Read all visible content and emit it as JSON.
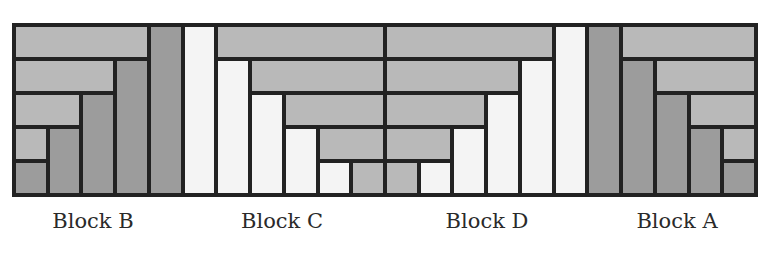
{
  "diagram": {
    "type": "log-cabin quilt blocks",
    "grid": {
      "columns": 22,
      "rows": 5,
      "border_px": 4
    },
    "colors": {
      "light": "#b9b9b9",
      "dark": "#9c9c9c",
      "white": "#f4f4f4",
      "line": "#222222"
    },
    "blocks": [
      {
        "label": "Block B",
        "col_start": 0,
        "col_end": 5,
        "label_x": 93
      },
      {
        "label": "Block C",
        "col_start": 5,
        "col_end": 11,
        "label_x": 282
      },
      {
        "label": "Block D",
        "col_start": 11,
        "col_end": 17,
        "label_x": 487
      },
      {
        "label": "Block A",
        "col_start": 17,
        "col_end": 22,
        "label_x": 677
      }
    ],
    "pieces": [
      {
        "block": "B",
        "c": 0,
        "r": 0,
        "w": 4,
        "h": 1,
        "color": "light"
      },
      {
        "block": "B",
        "c": 4,
        "r": 0,
        "w": 1,
        "h": 5,
        "color": "dark"
      },
      {
        "block": "B",
        "c": 0,
        "r": 1,
        "w": 3,
        "h": 1,
        "color": "light"
      },
      {
        "block": "B",
        "c": 3,
        "r": 1,
        "w": 1,
        "h": 4,
        "color": "dark"
      },
      {
        "block": "B",
        "c": 0,
        "r": 2,
        "w": 2,
        "h": 1,
        "color": "light"
      },
      {
        "block": "B",
        "c": 2,
        "r": 2,
        "w": 1,
        "h": 3,
        "color": "dark"
      },
      {
        "block": "B",
        "c": 0,
        "r": 3,
        "w": 1,
        "h": 1,
        "color": "light"
      },
      {
        "block": "B",
        "c": 1,
        "r": 3,
        "w": 1,
        "h": 2,
        "color": "dark"
      },
      {
        "block": "B",
        "c": 0,
        "r": 4,
        "w": 1,
        "h": 1,
        "color": "dark"
      },
      {
        "block": "C",
        "c": 5,
        "r": 0,
        "w": 1,
        "h": 5,
        "color": "white"
      },
      {
        "block": "C",
        "c": 6,
        "r": 0,
        "w": 5,
        "h": 1,
        "color": "light"
      },
      {
        "block": "C",
        "c": 6,
        "r": 1,
        "w": 1,
        "h": 4,
        "color": "white"
      },
      {
        "block": "C",
        "c": 7,
        "r": 1,
        "w": 4,
        "h": 1,
        "color": "light"
      },
      {
        "block": "C",
        "c": 7,
        "r": 2,
        "w": 1,
        "h": 3,
        "color": "white"
      },
      {
        "block": "C",
        "c": 8,
        "r": 2,
        "w": 3,
        "h": 1,
        "color": "light"
      },
      {
        "block": "C",
        "c": 8,
        "r": 3,
        "w": 1,
        "h": 2,
        "color": "white"
      },
      {
        "block": "C",
        "c": 9,
        "r": 3,
        "w": 2,
        "h": 1,
        "color": "light"
      },
      {
        "block": "C",
        "c": 9,
        "r": 4,
        "w": 1,
        "h": 1,
        "color": "white"
      },
      {
        "block": "C",
        "c": 10,
        "r": 4,
        "w": 1,
        "h": 1,
        "color": "light"
      },
      {
        "block": "D",
        "c": 11,
        "r": 0,
        "w": 5,
        "h": 1,
        "color": "light"
      },
      {
        "block": "D",
        "c": 16,
        "r": 0,
        "w": 1,
        "h": 5,
        "color": "white"
      },
      {
        "block": "D",
        "c": 11,
        "r": 1,
        "w": 4,
        "h": 1,
        "color": "light"
      },
      {
        "block": "D",
        "c": 15,
        "r": 1,
        "w": 1,
        "h": 4,
        "color": "white"
      },
      {
        "block": "D",
        "c": 11,
        "r": 2,
        "w": 3,
        "h": 1,
        "color": "light"
      },
      {
        "block": "D",
        "c": 14,
        "r": 2,
        "w": 1,
        "h": 3,
        "color": "white"
      },
      {
        "block": "D",
        "c": 11,
        "r": 3,
        "w": 2,
        "h": 1,
        "color": "light"
      },
      {
        "block": "D",
        "c": 13,
        "r": 3,
        "w": 1,
        "h": 2,
        "color": "white"
      },
      {
        "block": "D",
        "c": 11,
        "r": 4,
        "w": 1,
        "h": 1,
        "color": "light"
      },
      {
        "block": "D",
        "c": 12,
        "r": 4,
        "w": 1,
        "h": 1,
        "color": "white"
      },
      {
        "block": "A",
        "c": 17,
        "r": 0,
        "w": 1,
        "h": 5,
        "color": "dark"
      },
      {
        "block": "A",
        "c": 18,
        "r": 0,
        "w": 4,
        "h": 1,
        "color": "light"
      },
      {
        "block": "A",
        "c": 18,
        "r": 1,
        "w": 1,
        "h": 4,
        "color": "dark"
      },
      {
        "block": "A",
        "c": 19,
        "r": 1,
        "w": 3,
        "h": 1,
        "color": "light"
      },
      {
        "block": "A",
        "c": 19,
        "r": 2,
        "w": 1,
        "h": 3,
        "color": "dark"
      },
      {
        "block": "A",
        "c": 20,
        "r": 2,
        "w": 2,
        "h": 1,
        "color": "light"
      },
      {
        "block": "A",
        "c": 20,
        "r": 3,
        "w": 1,
        "h": 2,
        "color": "dark"
      },
      {
        "block": "A",
        "c": 21,
        "r": 3,
        "w": 1,
        "h": 1,
        "color": "light"
      },
      {
        "block": "A",
        "c": 21,
        "r": 4,
        "w": 1,
        "h": 1,
        "color": "dark"
      }
    ]
  }
}
